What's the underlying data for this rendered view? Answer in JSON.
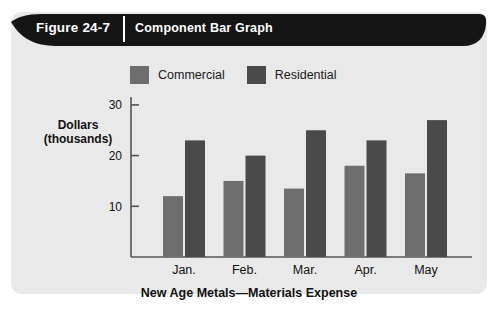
{
  "figure": {
    "number_label": "Figure 24-7",
    "caption": "Component Bar Graph"
  },
  "legend": {
    "position": "top",
    "items": [
      {
        "label": "Commercial",
        "color": "#6e6e6e",
        "swatch_name": "legend-swatch-commercial"
      },
      {
        "label": "Residential",
        "color": "#4a4a4a",
        "swatch_name": "legend-swatch-residential"
      }
    ]
  },
  "axes": {
    "y_axis_title_line1": "Dollars",
    "y_axis_title_line2": "(thousands)",
    "y_ticks": [
      "10",
      "20",
      "30"
    ],
    "x_categories": [
      "Jan.",
      "Feb.",
      "Mar.",
      "Apr.",
      "May"
    ]
  },
  "chart_data": {
    "type": "bar",
    "title": "New Age Metals—Materials Expense",
    "xlabel": "",
    "ylabel": "Dollars (thousands)",
    "categories": [
      "Jan.",
      "Feb.",
      "Mar.",
      "Apr.",
      "May"
    ],
    "series": [
      {
        "name": "Commercial",
        "color": "#6e6e6e",
        "values": [
          12,
          15,
          13.5,
          18,
          16.5
        ]
      },
      {
        "name": "Residential",
        "color": "#4a4a4a",
        "values": [
          23,
          20,
          25,
          23,
          27
        ]
      }
    ],
    "ylim": [
      0,
      31
    ],
    "yticks": [
      10,
      20,
      30
    ],
    "grid": false,
    "legend_position": "top"
  },
  "colors": {
    "panel_background": "#e9e9e9",
    "header_bar": "#151515",
    "header_text": "#ffffff",
    "axis_line": "#555555",
    "page_background": "#ffffff"
  }
}
